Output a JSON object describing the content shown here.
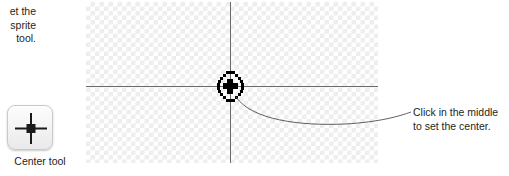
{
  "left_note": {
    "text": "et the\nsprite\ntool.",
    "note": "partially cropped instruction text"
  },
  "tool": {
    "icon": "crosshair-center-icon",
    "label": "Center tool"
  },
  "canvas": {
    "name": "sprite-canvas",
    "background": "transparent-checkerboard",
    "checker_color": "#ededed",
    "axis_color": "#6b6b6b",
    "marker": {
      "icon": "center-point-marker-icon",
      "color": "#000000"
    }
  },
  "callout": {
    "text": "Click in the middle\nto set the center.",
    "leader_color": "#4d4d4d"
  }
}
